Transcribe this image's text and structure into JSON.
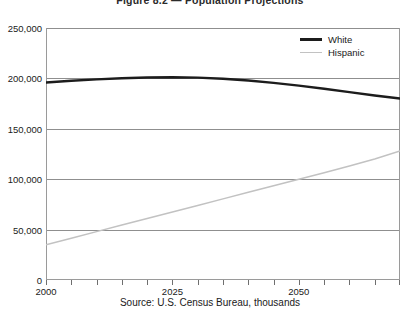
{
  "chart_data": {
    "type": "line",
    "title": "Figure 8.2 — Population Projections",
    "subtitle": "",
    "caption": "Source: U.S. Census Bureau, thousands",
    "xlabel": "",
    "ylabel": "",
    "xlim": [
      2000,
      2070
    ],
    "ylim": [
      0,
      250000
    ],
    "grid": true,
    "legend_position": "top-right",
    "y_ticks": [
      0,
      50000,
      100000,
      150000,
      200000,
      250000
    ],
    "y_tick_labels": [
      "0",
      "50,000",
      "100,000",
      "150,000",
      "200,000",
      "250,000"
    ],
    "x_ticks": [
      2000,
      2005,
      2010,
      2015,
      2020,
      2025,
      2030,
      2035,
      2040,
      2045,
      2050,
      2055,
      2060,
      2065,
      2070
    ],
    "x_tick_labels_shown": [
      {
        "x": 2000,
        "label": "2000"
      },
      {
        "x": 2025,
        "label": "2025"
      },
      {
        "x": 2050,
        "label": "2050"
      }
    ],
    "x": [
      2000,
      2005,
      2010,
      2015,
      2020,
      2025,
      2030,
      2035,
      2040,
      2045,
      2050,
      2055,
      2060,
      2065,
      2070
    ],
    "series": [
      {
        "name": "White",
        "color": "#1c1c1c",
        "width": 2.4,
        "values": [
          196000,
          197600,
          199000,
          200200,
          200900,
          201200,
          200800,
          199700,
          197900,
          195600,
          192800,
          189700,
          186400,
          183100,
          180000
        ]
      },
      {
        "name": "Hispanic",
        "color": "#c2c2c2",
        "width": 1.5,
        "values": [
          35000,
          41500,
          48000,
          54500,
          61000,
          67500,
          74000,
          80500,
          87000,
          93500,
          100000,
          106500,
          113000,
          120000,
          128000
        ]
      }
    ]
  },
  "legend": {
    "items": [
      {
        "label": "White"
      },
      {
        "label": "Hispanic"
      }
    ]
  }
}
